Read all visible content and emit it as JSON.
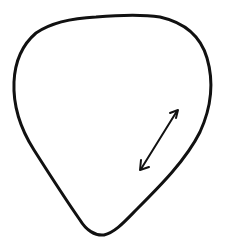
{
  "diagram": {
    "colors": {
      "background": "#ffffff",
      "stroke": "#111111"
    },
    "outline": {
      "shape": "rounded-inverted-triangle",
      "stroke_width": 3
    },
    "arrow": {
      "type": "double-headed",
      "from": [
        140,
        170
      ],
      "to": [
        178,
        110
      ],
      "stroke_width": 2
    }
  }
}
